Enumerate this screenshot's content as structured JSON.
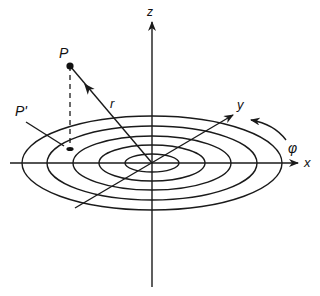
{
  "diagram": {
    "labels": {
      "z_axis": "z",
      "x_axis": "x",
      "y_axis": "y",
      "point": "P",
      "projection": "P'",
      "radius": "r",
      "angle": "φ"
    },
    "concentric_circles": 5,
    "colors": {
      "ink": "#1a1a1a",
      "background": "#ffffff"
    }
  }
}
